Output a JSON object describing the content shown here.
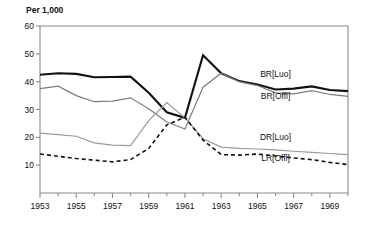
{
  "chart_data": {
    "type": "line",
    "title": "Per 1,000",
    "xlabel": "",
    "ylabel": "Per 1,000",
    "xlim": [
      1953,
      1970
    ],
    "ylim": [
      0,
      60
    ],
    "yticks": [
      10,
      20,
      30,
      40,
      50,
      60
    ],
    "ytick_labels": [
      "10",
      "20",
      "30",
      "40",
      "50",
      "60"
    ],
    "xticks": [
      1953,
      1955,
      1957,
      1959,
      1961,
      1963,
      1965,
      1967,
      1969
    ],
    "xtick_labels": [
      "1953",
      "1955",
      "1957",
      "1959",
      "1961",
      "1963",
      "1965",
      "1967",
      "1969"
    ],
    "x_minor_ticks": [
      1954,
      1956,
      1958,
      1960,
      1962,
      1964,
      1966,
      1968,
      1970
    ],
    "grid": false,
    "legend_position": "inline-right",
    "x": [
      1953,
      1954,
      1955,
      1956,
      1957,
      1958,
      1959,
      1960,
      1961,
      1962,
      1963,
      1964,
      1965,
      1966,
      1967,
      1968,
      1969,
      1970
    ],
    "series": [
      {
        "name": "BR[Luo]",
        "label": "BR[Luo]",
        "color": "#111111",
        "width": 2.1,
        "dash": "none",
        "label_x": 1966.0,
        "label_y": 41.5,
        "values": [
          42.5,
          43.0,
          42.8,
          41.6,
          41.7,
          41.8,
          36.0,
          29.0,
          27.0,
          49.5,
          43.0,
          40.2,
          39.0,
          37.2,
          37.5,
          38.3,
          37.0,
          36.6
        ]
      },
      {
        "name": "BR[Offl]",
        "label": "BR[Offl]",
        "color": "#7d7d7d",
        "width": 1.2,
        "dash": "none",
        "label_x": 1966.0,
        "label_y": 33.6,
        "values": [
          37.5,
          38.4,
          35.0,
          32.8,
          33.0,
          34.2,
          30.3,
          25.5,
          23.0,
          38.0,
          43.0,
          40.0,
          38.6,
          36.0,
          35.6,
          36.8,
          35.4,
          34.7
        ]
      },
      {
        "name": "DR[Luo]",
        "label": "DR[Luo]",
        "color": "#9a9a9a",
        "width": 1.2,
        "dash": "none",
        "label_x": 1966.0,
        "label_y": 19.2,
        "values": [
          21.5,
          21.0,
          20.4,
          18.0,
          17.2,
          17.0,
          26.0,
          32.5,
          27.0,
          19.5,
          16.5,
          16.0,
          15.8,
          15.5,
          15.0,
          14.6,
          14.2,
          13.8
        ]
      },
      {
        "name": "LR[Offl]",
        "label": "LR[Offl]",
        "color": "#111111",
        "width": 1.6,
        "dash": "4,3",
        "label_x": 1966.0,
        "label_y": 11.4,
        "values": [
          14.0,
          13.2,
          12.4,
          11.8,
          11.2,
          12.0,
          16.0,
          24.5,
          27.2,
          19.0,
          13.8,
          13.6,
          14.0,
          13.3,
          12.6,
          12.0,
          11.0,
          10.2
        ]
      }
    ]
  },
  "plot": {
    "left": 40,
    "top": 26,
    "right": 348,
    "bottom": 193
  }
}
